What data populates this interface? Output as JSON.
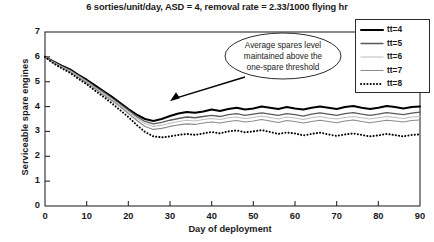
{
  "chart_data": {
    "type": "line",
    "title": "6 sorties/unit/day, ASD = 4, removal rate = 2.33/1000 flying hr",
    "xlabel": "Day of deployment",
    "ylabel": "Serviceable spare engines",
    "xlim": [
      0,
      90
    ],
    "ylim": [
      0,
      7
    ],
    "xticks": [
      0,
      10,
      20,
      30,
      40,
      50,
      60,
      70,
      80,
      90
    ],
    "yticks": [
      0,
      1,
      2,
      3,
      4,
      5,
      6,
      7
    ],
    "grid": false,
    "legend_position": "top-right",
    "annotations": [
      {
        "text_lines": [
          "Average spares level",
          "maintained above the",
          "one-spare threshold"
        ],
        "shape": "ellipse",
        "arrow_to_x": 30,
        "arrow_to_y": 4.05
      }
    ],
    "x": [
      0,
      2,
      4,
      6,
      8,
      10,
      12,
      14,
      16,
      18,
      20,
      22,
      24,
      26,
      28,
      30,
      32,
      34,
      36,
      38,
      40,
      42,
      44,
      46,
      48,
      50,
      52,
      54,
      56,
      58,
      60,
      62,
      64,
      66,
      68,
      70,
      72,
      74,
      76,
      78,
      80,
      82,
      84,
      86,
      88,
      90
    ],
    "series": [
      {
        "name": "tt=4",
        "color": "#000000",
        "style": "solid",
        "width": 2.0,
        "values": [
          6.0,
          5.82,
          5.65,
          5.5,
          5.28,
          5.08,
          4.85,
          4.62,
          4.4,
          4.15,
          3.9,
          3.68,
          3.5,
          3.42,
          3.5,
          3.62,
          3.72,
          3.78,
          3.75,
          3.8,
          3.88,
          3.82,
          3.9,
          3.95,
          3.88,
          3.92,
          4.0,
          3.95,
          3.9,
          3.98,
          3.92,
          3.88,
          3.95,
          4.0,
          3.95,
          3.9,
          3.98,
          4.02,
          3.95,
          3.9,
          3.95,
          4.02,
          3.98,
          3.92,
          3.98,
          4.0
        ]
      },
      {
        "name": "tt=5",
        "color": "#5a5a5a",
        "style": "solid",
        "width": 1.3,
        "values": [
          6.0,
          5.8,
          5.62,
          5.46,
          5.25,
          5.04,
          4.8,
          4.58,
          4.34,
          4.1,
          3.85,
          3.6,
          3.4,
          3.3,
          3.36,
          3.45,
          3.52,
          3.58,
          3.55,
          3.6,
          3.65,
          3.6,
          3.68,
          3.72,
          3.65,
          3.7,
          3.75,
          3.7,
          3.65,
          3.72,
          3.68,
          3.62,
          3.7,
          3.75,
          3.7,
          3.65,
          3.72,
          3.76,
          3.7,
          3.65,
          3.7,
          3.76,
          3.72,
          3.68,
          3.74,
          3.78
        ]
      },
      {
        "name": "tt=6",
        "color": "#bdbdbd",
        "style": "solid",
        "width": 1.2,
        "values": [
          6.0,
          5.78,
          5.6,
          5.44,
          5.22,
          5.0,
          4.76,
          4.54,
          4.3,
          4.05,
          3.8,
          3.54,
          3.32,
          3.2,
          3.25,
          3.33,
          3.4,
          3.45,
          3.42,
          3.48,
          3.52,
          3.48,
          3.55,
          3.58,
          3.52,
          3.56,
          3.62,
          3.56,
          3.5,
          3.58,
          3.54,
          3.48,
          3.55,
          3.6,
          3.54,
          3.5,
          3.56,
          3.6,
          3.55,
          3.5,
          3.55,
          3.6,
          3.56,
          3.52,
          3.58,
          3.6
        ]
      },
      {
        "name": "tt=7",
        "color": "#8c8c8c",
        "style": "solid",
        "width": 1.2,
        "values": [
          6.0,
          5.76,
          5.58,
          5.4,
          5.18,
          4.96,
          4.72,
          4.48,
          4.24,
          4.0,
          3.72,
          3.45,
          3.2,
          3.08,
          3.12,
          3.2,
          3.26,
          3.3,
          3.28,
          3.34,
          3.38,
          3.34,
          3.4,
          3.44,
          3.38,
          3.42,
          3.48,
          3.42,
          3.36,
          3.44,
          3.4,
          3.34,
          3.4,
          3.45,
          3.4,
          3.35,
          3.42,
          3.46,
          3.4,
          3.35,
          3.4,
          3.45,
          3.42,
          3.38,
          3.44,
          3.46
        ]
      },
      {
        "name": "tt=8",
        "color": "#000000",
        "style": "dotted",
        "width": 2.0,
        "values": [
          6.0,
          5.74,
          5.54,
          5.36,
          5.12,
          4.9,
          4.64,
          4.4,
          4.14,
          3.86,
          3.58,
          3.26,
          2.98,
          2.8,
          2.76,
          2.8,
          2.86,
          2.9,
          2.86,
          2.92,
          2.98,
          2.92,
          3.0,
          3.04,
          2.96,
          3.0,
          3.05,
          2.98,
          2.9,
          2.96,
          2.92,
          2.84,
          2.9,
          2.95,
          2.88,
          2.82,
          2.88,
          2.92,
          2.86,
          2.8,
          2.84,
          2.9,
          2.85,
          2.8,
          2.86,
          2.88
        ]
      }
    ]
  },
  "legend": {
    "items": [
      {
        "label": "tt=4"
      },
      {
        "label": "tt=5"
      },
      {
        "label": "tt=6"
      },
      {
        "label": "tt=7"
      },
      {
        "label": "tt=8"
      }
    ]
  }
}
